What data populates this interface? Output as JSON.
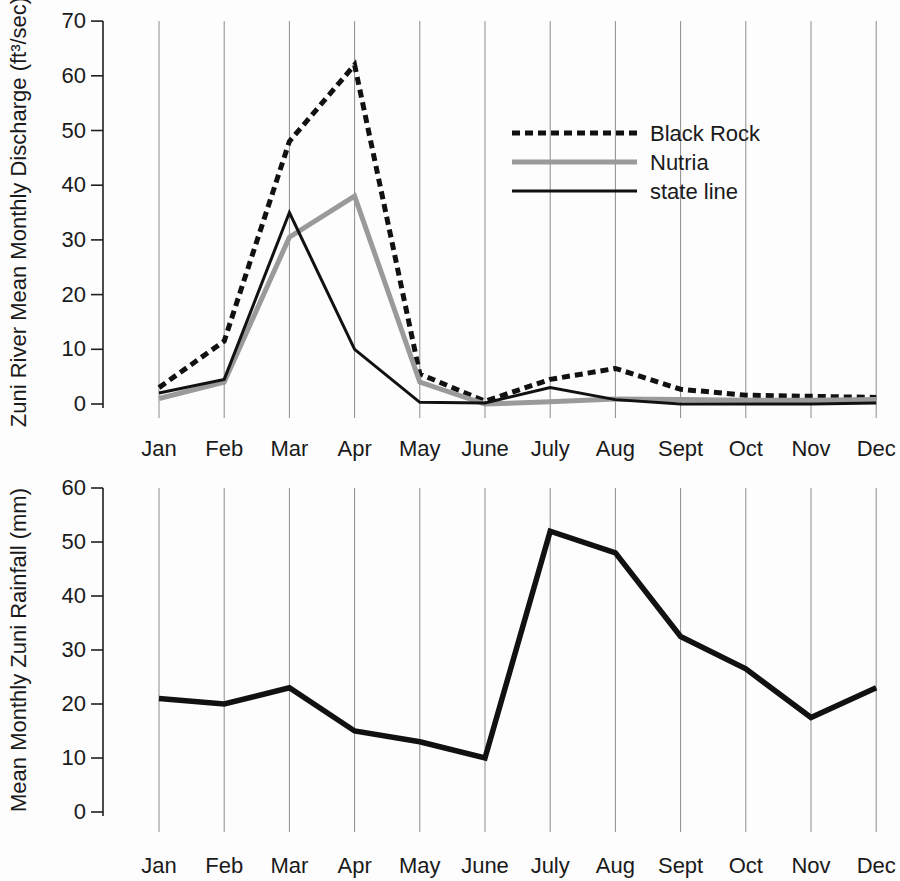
{
  "figure": {
    "background": "#fdfdfd",
    "grid_color": "#8c8c8c",
    "axis_color": "#1f1f1f",
    "text_color": "#1a1a1a"
  },
  "chart_data": [
    {
      "type": "line",
      "title": "",
      "xlabel": "",
      "ylabel": "Zuni River Mean Monthly Discharge (ft³/sec)",
      "categories": [
        "Jan",
        "Feb",
        "Mar",
        "Apr",
        "May",
        "June",
        "July",
        "Aug",
        "Sept",
        "Oct",
        "Nov",
        "Dec"
      ],
      "ylim": [
        0,
        70
      ],
      "yticks": [
        "0",
        "10",
        "20",
        "30",
        "40",
        "50",
        "60",
        "70"
      ],
      "grid": "vertical-only",
      "legend": {
        "position": "inside-upper-right"
      },
      "series": [
        {
          "name": "Black Rock",
          "color": "#111111",
          "line_style": "dashed",
          "dash": "8 5",
          "width": 5,
          "values": [
            3,
            11.5,
            48,
            62,
            5.5,
            0.5,
            4.5,
            6.5,
            2.7,
            1.6,
            1.4,
            1.2
          ]
        },
        {
          "name": "Nutria",
          "color": "#9a9a9a",
          "line_style": "solid",
          "dash": "",
          "width": 5,
          "values": [
            1,
            4,
            30.5,
            38,
            4,
            0,
            0.4,
            0.9,
            0.8,
            0.7,
            0.7,
            0.8
          ]
        },
        {
          "name": "state line",
          "color": "#111111",
          "line_style": "solid",
          "dash": "",
          "width": 3,
          "values": [
            2,
            4.5,
            35,
            10,
            0.3,
            0.2,
            3,
            0.8,
            0,
            0,
            0,
            0.2
          ]
        }
      ]
    },
    {
      "type": "line",
      "title": "",
      "xlabel": "",
      "ylabel": "Mean Monthly Zuni Rainfall (mm)",
      "categories": [
        "Jan",
        "Feb",
        "Mar",
        "Apr",
        "May",
        "June",
        "July",
        "Aug",
        "Sept",
        "Oct",
        "Nov",
        "Dec"
      ],
      "ylim": [
        0,
        60
      ],
      "yticks": [
        "0",
        "10",
        "20",
        "30",
        "40",
        "50",
        "60"
      ],
      "grid": "vertical-only",
      "legend": null,
      "series": [
        {
          "name": "Zuni rainfall",
          "color": "#111111",
          "line_style": "solid",
          "dash": "",
          "width": 5.5,
          "values": [
            21,
            20,
            23,
            15,
            13,
            10,
            52,
            48,
            32.5,
            26.5,
            17.5,
            23
          ]
        }
      ]
    }
  ]
}
